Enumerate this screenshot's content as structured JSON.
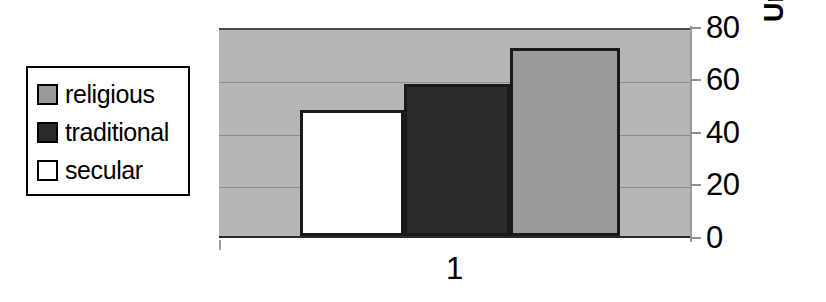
{
  "chart_data": {
    "type": "bar",
    "title": "",
    "xlabel": "",
    "ylabel": "Unwillingness (%)",
    "categories": [
      "1"
    ],
    "ylim": [
      0,
      80
    ],
    "yticks": [
      0,
      20,
      40,
      60,
      80
    ],
    "ytick_labels": [
      "0",
      "20",
      "40",
      "60",
      "80"
    ],
    "grid": true,
    "grid_axis": "y",
    "legend_position": "outside-left",
    "series": [
      {
        "name": "religious",
        "values": [
          71.5
        ],
        "color": "#9a9a9a"
      },
      {
        "name": "traditional",
        "values": [
          58
        ],
        "color": "#2a2a2a"
      },
      {
        "name": "secular",
        "values": [
          48
        ],
        "color": "#ffffff"
      }
    ],
    "bar_draw_order": [
      "secular",
      "traditional",
      "religious"
    ],
    "plot_background": "#b6b6b6",
    "bar_edge_color": "#1a1a1a"
  },
  "legend": {
    "items": [
      {
        "label": "religious",
        "swatch_color": "#9a9a9a"
      },
      {
        "label": "traditional",
        "swatch_color": "#2a2a2a"
      },
      {
        "label": "secular",
        "swatch_color": "#ffffff"
      }
    ]
  },
  "y_axis": {
    "title": "Unwillingness (%)",
    "ticks": [
      {
        "label": "80",
        "value": 80
      },
      {
        "label": "60",
        "value": 60
      },
      {
        "label": "40",
        "value": 40
      },
      {
        "label": "20",
        "value": 20
      },
      {
        "label": "0",
        "value": 0
      }
    ]
  },
  "x_axis": {
    "ticks": [
      {
        "label": "1"
      }
    ]
  }
}
